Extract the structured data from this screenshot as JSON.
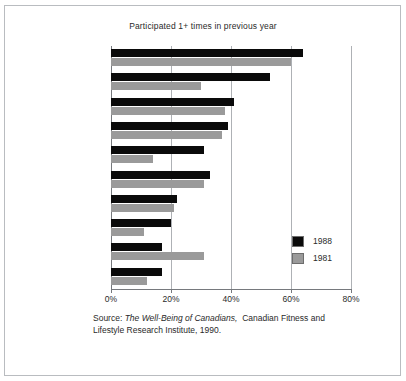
{
  "chart_data": {
    "type": "bar",
    "orientation": "horizontal",
    "title": "Participated 1+ times in previous year",
    "xlabel": "",
    "ylabel": "",
    "categories": [
      "Walking",
      "Gardening",
      "Swimming",
      "Bicycling",
      "Social dancing",
      "Home exercise",
      "Skating",
      "Alpine skiing",
      "Jogging",
      "Golf"
    ],
    "series": [
      {
        "name": "1988",
        "color": "#0a0a0a",
        "values": [
          64,
          53,
          41,
          39,
          31,
          33,
          22,
          20,
          17,
          17
        ]
      },
      {
        "name": "1981",
        "color": "#9a9a9a",
        "values": [
          60,
          30,
          38,
          37,
          14,
          31,
          21,
          11,
          31,
          12
        ]
      }
    ],
    "xlim": [
      0,
      80
    ],
    "xticks": [
      0,
      20,
      40,
      60,
      80
    ],
    "xtick_labels": [
      "0%",
      "20%",
      "40%",
      "60%",
      "80%"
    ],
    "grid": true,
    "grid_axis": "x",
    "legend_position": "right",
    "units": "percent"
  },
  "legend": {
    "entries": [
      {
        "label": "1988",
        "swatch": "sw1988"
      },
      {
        "label": "1981",
        "swatch": "sw1981"
      }
    ]
  },
  "source": {
    "prefix": "Source:",
    "italic_title": "The Well-Being of Canadians,",
    "rest": "Canadian Fitness and",
    "line2": "Lifestyle Research Institute, 1990."
  },
  "colors": {
    "series_1988": "#0a0a0a",
    "series_1981": "#9a9a9a",
    "grid": "#aeb1b5",
    "axis": "#76797d",
    "frame": "#b9bcc0",
    "text": "#2a2a2a",
    "background": "#ffffff"
  }
}
